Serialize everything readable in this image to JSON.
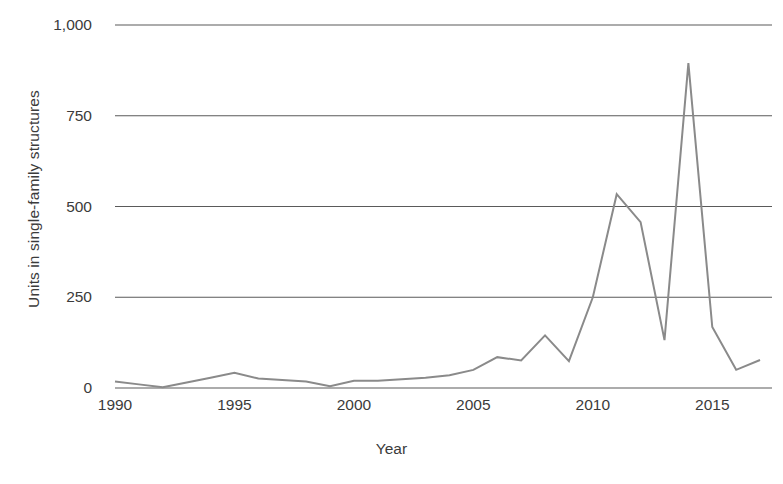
{
  "chart_data": {
    "type": "line",
    "title": "",
    "xlabel": "Year",
    "ylabel": "Units in single-family structures",
    "xlim": [
      1990,
      2017.5
    ],
    "ylim": [
      0,
      1000
    ],
    "grid": true,
    "legend": "none",
    "line_color": "#8a8a8a",
    "grid_color": "#5a5a5a",
    "x_ticks": [
      1990,
      1995,
      2000,
      2005,
      2010,
      2015
    ],
    "x_tick_labels": [
      "1990",
      "1995",
      "2000",
      "2005",
      "2010",
      "2015"
    ],
    "y_ticks": [
      0,
      250,
      500,
      750,
      1000
    ],
    "y_tick_labels": [
      "0",
      "250",
      "500",
      "750",
      "1,000"
    ],
    "x": [
      1990,
      1991,
      1992,
      1993,
      1994,
      1995,
      1996,
      1997,
      1998,
      1999,
      2000,
      2001,
      2002,
      2003,
      2004,
      2005,
      2006,
      2007,
      2008,
      2009,
      2010,
      2011,
      2012,
      2013,
      2014,
      2015,
      2016,
      2017
    ],
    "values": [
      18,
      10,
      2,
      15,
      28,
      42,
      26,
      22,
      18,
      5,
      20,
      20,
      24,
      28,
      35,
      50,
      85,
      76,
      145,
      74,
      250,
      534,
      457,
      132,
      895,
      168,
      50,
      77
    ],
    "series": [
      {
        "name": "Units in single-family structures",
        "values": [
          18,
          10,
          2,
          15,
          28,
          42,
          26,
          22,
          18,
          5,
          20,
          20,
          24,
          28,
          35,
          50,
          85,
          76,
          145,
          74,
          250,
          534,
          457,
          132,
          895,
          168,
          50,
          77
        ]
      }
    ],
    "annotations": []
  },
  "axes": {
    "y_title": "Units in single-family structures",
    "x_title": "Year"
  }
}
